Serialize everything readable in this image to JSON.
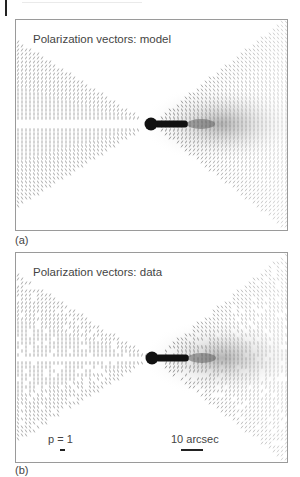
{
  "figure": {
    "panels": [
      {
        "id": "a",
        "title": "Polarization vectors: model",
        "caption_label": "(a)"
      },
      {
        "id": "b",
        "title": "Polarization vectors: data",
        "caption_label": "(b)",
        "scale_legend": {
          "polarization_label": "p = 1",
          "distance_label": "10 arcsec"
        }
      }
    ],
    "colors": {
      "frame": "#9a9a9a",
      "vectors": "#333333",
      "core": "#111111"
    }
  }
}
